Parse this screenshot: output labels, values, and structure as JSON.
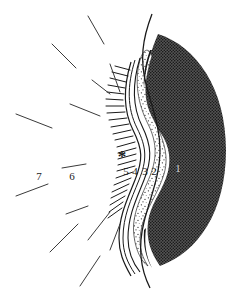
{
  "figure": {
    "kind": "anatomical-cross-section-diagram",
    "background_color": "#ffffff",
    "width": 248,
    "height": 296,
    "marker": {
      "name": "asterisk-marker",
      "glyph": "*",
      "x": 122,
      "y": 157
    },
    "labels": [
      {
        "id": "1",
        "text": "1",
        "x": 178,
        "y": 172,
        "style": "faint",
        "region": "dark-stippled-outer-zone"
      },
      {
        "id": "2",
        "text": "2",
        "x": 154,
        "y": 175,
        "style": "normal",
        "region": "dotted-middle-zone"
      },
      {
        "id": "3",
        "text": "3",
        "x": 145,
        "y": 175,
        "style": "normal",
        "region": "inner-band"
      },
      {
        "id": "4",
        "text": "4",
        "x": 135,
        "y": 175,
        "style": "normal",
        "region": "thin-line-band"
      },
      {
        "id": "5",
        "text": "5",
        "x": 126,
        "y": 175,
        "style": "normal",
        "region": "fringe-base"
      },
      {
        "id": "6",
        "text": "6",
        "x": 72,
        "y": 180,
        "style": "normal",
        "region": "free-space-left"
      },
      {
        "id": "7",
        "text": "7",
        "x": 39,
        "y": 180,
        "style": "normal",
        "region": "free-space-far-left"
      }
    ],
    "label_underlines": [
      {
        "for": "6",
        "x1": 62,
        "y1": 168,
        "x2": 86,
        "y2": 164
      }
    ],
    "zones": [
      {
        "name": "dark-stippled-outer-zone",
        "label_ref": "1",
        "texture": "fine-crosshatch",
        "color": "#4a4a4a"
      },
      {
        "name": "dotted-middle-zone",
        "label_ref": "2",
        "texture": "sparse-stipple",
        "color": "#ffffff"
      },
      {
        "name": "inner-band",
        "label_ref": "3",
        "texture": "plain-white",
        "color": "#ffffff"
      },
      {
        "name": "thin-line-band",
        "label_ref": "4",
        "texture": "plain-white",
        "color": "#ffffff"
      },
      {
        "name": "fringe-zone",
        "label_ref": "5",
        "texture": "comb-teeth",
        "color": "#1a1a1a"
      }
    ],
    "leader_lines": [
      {
        "x1": 88,
        "y1": 16,
        "x2": 104,
        "y2": 44
      },
      {
        "x1": 52,
        "y1": 44,
        "x2": 76,
        "y2": 68
      },
      {
        "x1": 110,
        "y1": 64,
        "x2": 120,
        "y2": 92
      },
      {
        "x1": 92,
        "y1": 80,
        "x2": 110,
        "y2": 94
      },
      {
        "x1": 16,
        "y1": 114,
        "x2": 52,
        "y2": 128
      },
      {
        "x1": 70,
        "y1": 104,
        "x2": 100,
        "y2": 116
      },
      {
        "x1": 16,
        "y1": 196,
        "x2": 48,
        "y2": 184
      },
      {
        "x1": 66,
        "y1": 214,
        "x2": 88,
        "y2": 206
      },
      {
        "x1": 50,
        "y1": 252,
        "x2": 78,
        "y2": 224
      },
      {
        "x1": 88,
        "y1": 240,
        "x2": 110,
        "y2": 212
      },
      {
        "x1": 80,
        "y1": 286,
        "x2": 100,
        "y2": 256
      },
      {
        "x1": 110,
        "y1": 250,
        "x2": 120,
        "y2": 224
      }
    ]
  }
}
